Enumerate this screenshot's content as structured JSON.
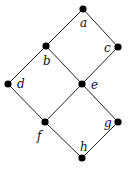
{
  "diagram": {
    "type": "hasse-diagram",
    "colors": {
      "node": "#000000",
      "edge": "#222222",
      "background": "#ffffff"
    },
    "nodes": [
      {
        "id": "a",
        "label": "a",
        "x": 83,
        "y": 9,
        "lx": 80,
        "ly": 27
      },
      {
        "id": "b",
        "label": "b",
        "x": 46,
        "y": 46,
        "lx": 43,
        "ly": 65
      },
      {
        "id": "c",
        "label": "c",
        "x": 118,
        "y": 47,
        "lx": 104,
        "ly": 52
      },
      {
        "id": "d",
        "label": "d",
        "x": 8,
        "y": 84,
        "lx": 17,
        "ly": 88
      },
      {
        "id": "e",
        "label": "e",
        "x": 82,
        "y": 84,
        "lx": 91,
        "ly": 89
      },
      {
        "id": "f",
        "label": "f",
        "x": 45,
        "y": 122,
        "lx": 37,
        "ly": 140
      },
      {
        "id": "g",
        "label": "g",
        "x": 118,
        "y": 122,
        "lx": 104,
        "ly": 127
      },
      {
        "id": "h",
        "label": "h",
        "x": 82,
        "y": 158,
        "lx": 80,
        "ly": 151
      }
    ],
    "edges": [
      [
        "a",
        "b"
      ],
      [
        "a",
        "c"
      ],
      [
        "b",
        "d"
      ],
      [
        "b",
        "e"
      ],
      [
        "c",
        "e"
      ],
      [
        "d",
        "f"
      ],
      [
        "e",
        "f"
      ],
      [
        "e",
        "g"
      ],
      [
        "f",
        "h"
      ],
      [
        "g",
        "h"
      ]
    ]
  }
}
